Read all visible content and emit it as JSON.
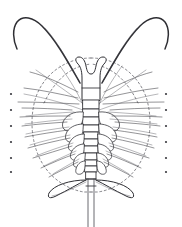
{
  "figure": {
    "title": "Arthropod larva, dorsal view",
    "caption": "",
    "background_color": "#ffffff",
    "ink_color": "#2e2e33",
    "dashed_color": "#55555c",
    "width_px": 182,
    "height_px": 227
  },
  "chart_data": {
    "type": "scatter",
    "title": "Arthropod larva, dorsal view",
    "xlabel": "",
    "ylabel": "",
    "grid": false,
    "legend": null,
    "xlim": [
      0,
      182
    ],
    "ylim": [
      0,
      227
    ],
    "annotations": [],
    "parts": [
      {
        "name": "left-antenna",
        "count": 1
      },
      {
        "name": "right-antenna",
        "count": 1
      },
      {
        "name": "head-shield",
        "count": 1
      },
      {
        "name": "trunk-segment",
        "count": 11
      },
      {
        "name": "limb-pair",
        "count": 11
      },
      {
        "name": "carapace-outline",
        "count": 1
      },
      {
        "name": "uropod-lobe",
        "count": 2
      },
      {
        "name": "telson",
        "count": 1
      },
      {
        "name": "margin-dot",
        "count": 13
      }
    ],
    "margin_dots_left_x": 11,
    "margin_dots_right_x": 166,
    "margin_dots_y": [
      94,
      110,
      126,
      142,
      158,
      172
    ],
    "trunk_axis_x": 91,
    "trunk_top_y": 100,
    "trunk_bottom_y": 180,
    "telson_tip_y": 227
  }
}
